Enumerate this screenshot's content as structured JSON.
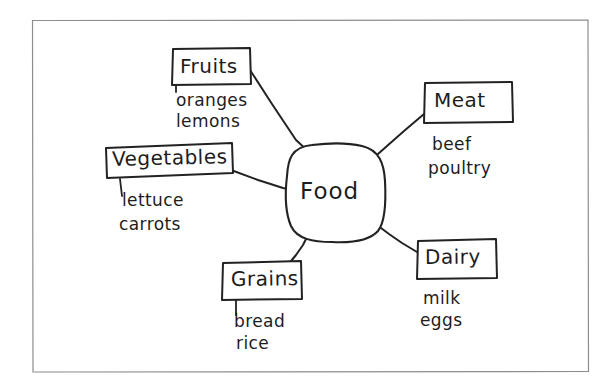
{
  "document": {
    "kind": "hand-drawn concept map",
    "frame_color": "#8a8a8a",
    "ink_color": "#1d1d1d",
    "paper_color": "#ffffff"
  },
  "center": {
    "label": "Food",
    "shape": "rounded-blob"
  },
  "branches": [
    {
      "id": "fruits",
      "label": "Fruits",
      "items": [
        "oranges",
        "lemons"
      ]
    },
    {
      "id": "vegetables",
      "label": "Vegetables",
      "items": [
        "lettuce",
        "carrots"
      ]
    },
    {
      "id": "meat",
      "label": "Meat",
      "items": [
        "beef",
        "poultry"
      ]
    },
    {
      "id": "dairy",
      "label": "Dairy",
      "items": [
        "milk",
        "eggs"
      ]
    },
    {
      "id": "grains",
      "label": "Grains",
      "items": [
        "bread",
        "rice"
      ]
    }
  ]
}
